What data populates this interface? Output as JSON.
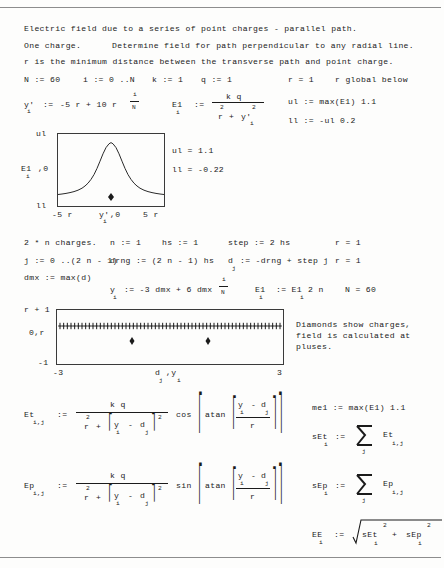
{
  "document": {
    "kind": "mathcad-worksheet",
    "title_lines": [
      "Electric field due to a series of point charges - parallel path.",
      "One charge.          Determine field for path perpendicular to any radial line.",
      "r is the minimum distance between the transverse path and point charge."
    ],
    "line1": "Electric field due to a series of point charges - parallel path.",
    "line2a": "One charge.",
    "line2b": "Determine field for path perpendicular to any radial line.",
    "line3": "r is the minimum distance between the transverse path and point charge."
  },
  "defs_row1": {
    "N": "N := 60",
    "i": "i := 0 ..N",
    "k": "k := 1",
    "q": "q := 1",
    "r_eval": "r = 1",
    "r_note": "r global below"
  },
  "yprime_def": {
    "lhs": "y'",
    "lhs_sub": "i",
    "assign": ":=",
    "rhs": "-5 r + 10 r",
    "frac_num": "i",
    "frac_den": "N"
  },
  "E1_def": {
    "lhs": "E1",
    "lhs_sub": "i",
    "assign": ":=",
    "num": "k q",
    "den_r": "r",
    "den_r_sup": "2",
    "den_plus": "+",
    "den_y": "y'",
    "den_y_sub": "i",
    "den_y_sup": "2"
  },
  "limits_right": {
    "ul_def": "ul := max(E1) 1.1",
    "ll_def": "ll := -ul 0.2",
    "ul_val": "ul = 1.1",
    "ll_val": "ll = -0.22"
  },
  "plot1": {
    "y_top_label": "ul",
    "y_mid_label": "E1",
    "y_mid_sub": "i",
    "y_mid_suffix": ",0",
    "y_bot_label": "ll",
    "x_left_label": "-5 r",
    "x_mid_label": "y'",
    "x_mid_sub": "i",
    "x_mid_suffix": ",0",
    "x_right_label": "5 r",
    "marker": "diamond"
  },
  "chart_data": {
    "type": "line",
    "title": "",
    "xlabel": "y'i , 0",
    "ylabel": "E1i , 0",
    "xlim": [
      -5,
      5
    ],
    "ylim": [
      -0.22,
      1.1
    ],
    "grid": false,
    "legend": "none",
    "series": [
      {
        "name": "E1 = k q / (r^2 + y'^2)",
        "x": [
          -5,
          -4.5,
          -4,
          -3.5,
          -3,
          -2.5,
          -2,
          -1.5,
          -1.25,
          -1,
          -0.75,
          -0.5,
          -0.25,
          0,
          0.25,
          0.5,
          0.75,
          1,
          1.25,
          1.5,
          2,
          2.5,
          3,
          3.5,
          4,
          4.5,
          5
        ],
        "y": [
          0.038,
          0.047,
          0.059,
          0.076,
          0.1,
          0.138,
          0.2,
          0.308,
          0.39,
          0.5,
          0.64,
          0.8,
          0.94,
          1.0,
          0.94,
          0.8,
          0.64,
          0.5,
          0.39,
          0.308,
          0.2,
          0.138,
          0.1,
          0.076,
          0.059,
          0.047,
          0.038
        ]
      }
    ],
    "markers": [
      {
        "name": "charge-diamond",
        "x": 0,
        "y": -0.05
      }
    ]
  },
  "section2": {
    "heading": "2 * n charges.",
    "n_def": "n := 1",
    "hs_def": "hs := 1",
    "step_def": "step := 2 hs",
    "r_eval_1": "r = 1",
    "j_def": "j := 0 ..(2 n - 1)",
    "drng_def": "drng := (2 n - 1) hs",
    "d_lhs": "d",
    "d_sub": "j",
    "d_rhs": ":= -drng + step j",
    "r_eval_2": "r = 1",
    "dmx_def": "dmx := max(d)",
    "y_lhs": "y",
    "y_sub": "i",
    "y_rhs": ":= -3 dmx + 6 dmx",
    "y_frac_num": "i",
    "y_frac_den": "N",
    "E1_redef_lhs": "E1",
    "E1_redef_sub": "i",
    "E1_redef_rhs": ":= E1",
    "E1_redef_sub2": "i",
    "E1_redef_tail": "2 n",
    "N_eval": "N = 60"
  },
  "plot2": {
    "y_top_label": "r + 1",
    "y_mid_label": "0,r",
    "y_bot_label": "-1",
    "x_left_label": "-3",
    "x_mid_label": "d",
    "x_mid_sub": "j",
    "x_mid_label2": ",y",
    "x_mid_sub2": "i",
    "x_right_label": "3",
    "plus_count": 61
  },
  "chart_data2": {
    "type": "scatter",
    "title": "",
    "xlabel": "d j , y i",
    "ylabel": "0, r",
    "xlim": [
      -3,
      3
    ],
    "ylim": [
      -1,
      2
    ],
    "grid": false,
    "legend": "none",
    "series": [
      {
        "name": "field-points (pluses)",
        "marker": "plus",
        "y_constant": 1.0,
        "n_points": 61,
        "x_from": -3,
        "x_to": 3
      },
      {
        "name": "charges (diamonds)",
        "marker": "diamond",
        "x": [
          -1,
          1
        ],
        "y": [
          0,
          0
        ]
      }
    ]
  },
  "note_right": {
    "l1": "Diamonds show charges,",
    "l2": "field is calculated at",
    "l3": "pluses."
  },
  "Et_def": {
    "lhs": "Et",
    "lhs_sub": "i,j",
    "assign": ":=",
    "num": "k q",
    "den_r": "r",
    "den_r_sup": "2",
    "den_plus": "+",
    "den_y": "y",
    "den_y_sub": "i",
    "den_minus": "-",
    "den_d": "d",
    "den_d_sub": "j",
    "den_sup": "2",
    "trig": "cos",
    "fn": "atan",
    "arg_num_y": "y",
    "arg_num_y_sub": "i",
    "arg_num_minus": "-",
    "arg_num_d": "d",
    "arg_num_d_sub": "j",
    "arg_den": "r"
  },
  "Ep_def": {
    "lhs": "Ep",
    "lhs_sub": "i,j",
    "assign": ":=",
    "num": "k q",
    "den_r": "r",
    "den_r_sup": "2",
    "den_plus": "+",
    "den_y": "y",
    "den_y_sub": "i",
    "den_minus": "-",
    "den_d": "d",
    "den_d_sub": "j",
    "den_sup": "2",
    "trig": "sin",
    "fn": "atan",
    "arg_num_y": "y",
    "arg_num_y_sub": "i",
    "arg_num_minus": "-",
    "arg_num_d": "d",
    "arg_num_d_sub": "j",
    "arg_den": "r"
  },
  "right_col": {
    "me1_def": "me1 := max(E1) 1.1",
    "sEt_lhs": "sEt",
    "sEt_sub": "i",
    "sEt_assign": ":=",
    "sEt_sigma_sub": "j",
    "sEt_term": "Et",
    "sEt_term_sub": "i,j",
    "sEp_lhs": "sEp",
    "sEp_sub": "i",
    "sEp_assign": ":=",
    "sEp_sigma_sub": "j",
    "sEp_term": "Ep",
    "sEp_term_sub": "i,j",
    "EE_lhs": "EE",
    "EE_sub": "i",
    "EE_assign": ":=",
    "EE_a": "sEt",
    "EE_a_sub": "i",
    "EE_a_sup": "2",
    "EE_plus": "+",
    "EE_b": "sEp",
    "EE_b_sub": "i",
    "EE_b_sup": "2"
  },
  "colors": {
    "ink": "#1b1b1b",
    "paper": "#fdfdfc",
    "rule": "#8d8d8d",
    "frame": "#3a3a3a"
  }
}
